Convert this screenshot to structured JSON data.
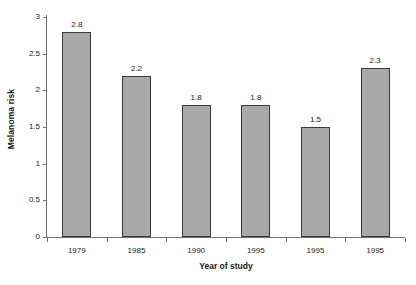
{
  "chart_data": {
    "type": "bar",
    "title": "",
    "xlabel": "Year  of study",
    "ylabel": "Melanoma risk",
    "categories": [
      "1979",
      "1985",
      "1990",
      "1995",
      "1995",
      "1995"
    ],
    "values": [
      2.8,
      2.2,
      1.8,
      1.8,
      1.5,
      2.3
    ],
    "value_labels": [
      "2.8",
      "2.2",
      "1.8",
      "1.8",
      "1.5",
      "2.3"
    ],
    "ylim": [
      0,
      3
    ],
    "yticks": [
      0,
      0.5,
      1,
      1.5,
      2,
      2.5,
      3
    ],
    "ytick_labels": [
      "0",
      "0.5",
      "1",
      "1.5",
      "2",
      "2.5",
      "3"
    ],
    "grid": false,
    "legend": null,
    "bar_fill_color": "#a9a9a9",
    "bar_border_color": "#3b3b3b",
    "axis_color": "#6f6f6f",
    "background_color": "#ffffff"
  }
}
